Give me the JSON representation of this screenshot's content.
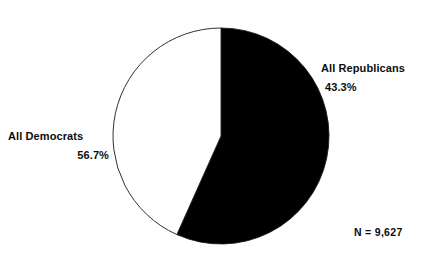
{
  "chart_data": {
    "type": "pie",
    "title": "",
    "subtitle": "",
    "xlabel": "",
    "ylabel": "",
    "legend_position": "none",
    "grid": false,
    "start_angle_deg": 0,
    "direction": "clockwise",
    "categories": [
      "All Democrats",
      "All Republicans"
    ],
    "values": [
      56.7,
      43.3
    ],
    "value_unit": "%",
    "total_n": 9627,
    "slices": [
      {
        "label": "All Democrats",
        "value": 56.7,
        "value_text": "56.7%",
        "color": "#000000",
        "start_angle_deg": 0,
        "end_angle_deg": 204.12
      },
      {
        "label": "All Republicans",
        "value": 43.3,
        "value_text": "43.3%",
        "color": "#ffffff",
        "start_angle_deg": 204.12,
        "end_angle_deg": 360
      }
    ],
    "annotations": [
      "N = 9,627"
    ]
  },
  "labels": {
    "republicans": {
      "name": "All Republicans",
      "value": "43.3%"
    },
    "democrats": {
      "name": "All Democrats",
      "value": "56.7%"
    },
    "sample_size": "N = 9,627"
  },
  "style": {
    "background": "#ffffff",
    "outline_color": "#1a1a1a",
    "democrat_fill": "#000000",
    "republican_fill": "#ffffff",
    "text_color": "#0d0d0d"
  }
}
